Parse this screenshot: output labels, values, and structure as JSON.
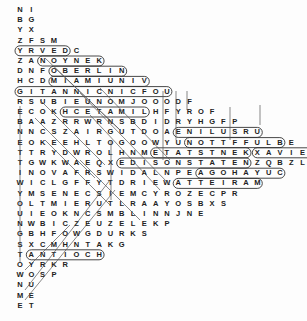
{
  "puzzle": {
    "title": "Word Search",
    "origin_x": 20,
    "origin_y": 10,
    "cell_w": 11.3,
    "cell_h": 10.2,
    "rows": [
      "NI",
      "BG",
      "YX",
      "ZFSM",
      "YRVEDC",
      "ZANOYNEK",
      "DNFOBERLIN",
      "HCDMIAMIUNIV",
      "GITANNICNICFOU",
      "RSUBIEUNOMJOOODF",
      "ECOKHCETAMILHFYROF",
      "BAAZRRWRNSBDIDRYHGFP",
      "NNCSZAIRGUTDOAENILUSRU",
      "EOKEEHLTOGOOWYUNOTTFFULBE",
      "TTRYDWROLHNMETATSTNEKXAVIERMX",
      "TGWKWAEQXEDISONSTATENZQBZLROE",
      "INOVAFRSWIDALNPEAGOHAYUC",
      "WICLGFFYTDRIEWATTEIRAM",
      "YMSENECSIEMCYROZECPR",
      "OLTMIERUTLRAAYOSBXS",
      "UIEOKNCSMBLINNJNE",
      "NWBICZEUZELEKP",
      "GBHFOWGDURKS",
      "SXCMHNTAKG",
      "TANTIOCH",
      "OYRKR",
      "WOSP",
      "NU",
      "ME",
      "ET"
    ],
    "found_words": [
      {
        "word": "DEVRY",
        "dir": "horizontal",
        "row": 4,
        "start": 0,
        "end": 4
      },
      {
        "word": "KENYON",
        "dir": "horizontal",
        "row": 5,
        "start": 2,
        "end": 7
      },
      {
        "word": "OBERLIN",
        "dir": "horizontal",
        "row": 6,
        "start": 3,
        "end": 9
      },
      {
        "word": "MIAMI UNIV",
        "dir": "horizontal",
        "row": 7,
        "start": 3,
        "end": 11
      },
      {
        "word": "UOFCINCINNATI",
        "dir": "horizontal",
        "row": 8,
        "start": 0,
        "end": 13
      },
      {
        "word": "LIMATECH",
        "dir": "horizontal",
        "row": 10,
        "start": 4,
        "end": 11
      },
      {
        "word": "URSULINE",
        "dir": "horizontal",
        "row": 12,
        "start": 14,
        "end": 21
      },
      {
        "word": "BLUFFTON",
        "dir": "horizontal",
        "row": 13,
        "start": 15,
        "end": 23
      },
      {
        "word": "KENT STATE",
        "dir": "horizontal",
        "row": 14,
        "start": 12,
        "end": 20
      },
      {
        "word": "XAVIER",
        "dir": "horizontal",
        "row": 14,
        "start": 21,
        "end": 26
      },
      {
        "word": "EDISON STATE",
        "dir": "horizontal",
        "row": 15,
        "start": 9,
        "end": 20
      },
      {
        "word": "CUYAHOGA",
        "dir": "horizontal",
        "row": 16,
        "start": 16,
        "end": 23
      },
      {
        "word": "MARIETTA",
        "dir": "horizontal",
        "row": 17,
        "start": 14,
        "end": 21
      },
      {
        "word": "ANTIOCH",
        "dir": "horizontal",
        "row": 24,
        "start": 1,
        "end": 7
      }
    ]
  }
}
